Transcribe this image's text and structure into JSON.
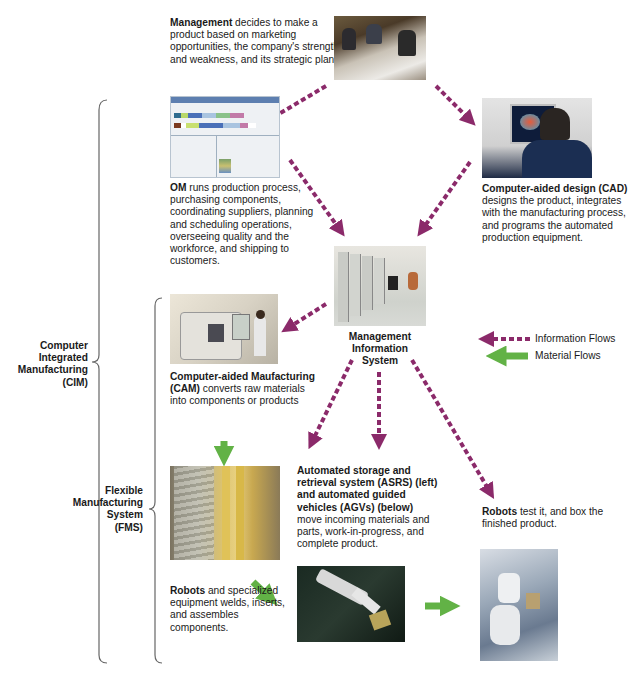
{
  "management": {
    "bold": "Management",
    "text": " decides to make a product based on marketing opportunities, the company's strength and weakness, and its strategic plans.",
    "photo": "management-meeting-photo"
  },
  "om": {
    "bold": "OM",
    "text": " runs production process, purchasing components, coordinating suppliers, planning and scheduling operations, overseeing quality and the workforce, and shipping to customers.",
    "photo": "om-software-screenshot"
  },
  "cad": {
    "bold": "Computer-aided design (CAD)",
    "text": " designs the product, integrates with the manufacturing process, and programs the automated production equipment.",
    "photo": "cad-workstation-photo"
  },
  "mis": {
    "label_line1": "Management",
    "label_line2": "Information",
    "label_line3": "System",
    "photo": "server-room-photo"
  },
  "cam": {
    "bold": "Computer-aided Maufacturing (CAM)",
    "text": " converts raw materials into components or products",
    "photo": "cnc-machine-photo"
  },
  "asrs": {
    "bold": "Automated storage and retrieval system (ASRS) (left) and automated guided vehicles (AGVs) (below)",
    "text": " move incoming materials and parts, work-in-progress, and complete product.",
    "photo": "asrs-warehouse-photo"
  },
  "robots_assemble": {
    "bold": "Robots",
    "text": " and specialized equipment welds, inserts, and assembles components.",
    "photo": "robot-gripper-photo"
  },
  "robots_test": {
    "bold": "Robots",
    "text": " test it, and box the finished product.",
    "photo": "robot-arm-photo"
  },
  "brackets": {
    "cim": [
      "Computer",
      "Integrated",
      "Manufacturing",
      "(CIM)"
    ],
    "fms": [
      "Flexible",
      "Manufacturing",
      "System",
      "(FMS)"
    ]
  },
  "legend": {
    "information": "Information Flows",
    "material": "Material Flows"
  },
  "colors": {
    "information_flow": "#8b2a6a",
    "material_flow": "#62b246",
    "bracket": "#555555"
  }
}
